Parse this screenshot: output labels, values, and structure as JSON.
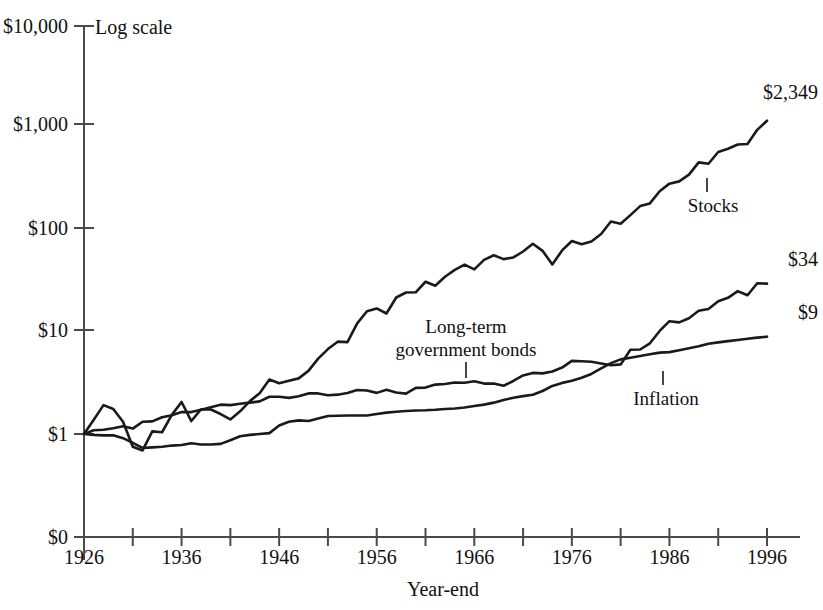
{
  "chart_data": {
    "type": "line",
    "title": "",
    "subtitle": "",
    "scale_note": "Log scale",
    "xlabel": "Year-end",
    "ylabel": "",
    "yscale": "log",
    "xlim": [
      1926,
      1996
    ],
    "ylim": [
      1,
      10000
    ],
    "grid": false,
    "legend_position": "inline-annotations",
    "ytick_labels": [
      "$10,000",
      "$1,000",
      "$100",
      "$10",
      "$1",
      "$0"
    ],
    "ytick_values": [
      10000,
      1000,
      100,
      10,
      1,
      0
    ],
    "xtick_labels": [
      "1926",
      "1936",
      "1946",
      "1956",
      "1966",
      "1976",
      "1986",
      "1996"
    ],
    "xtick_values": [
      1926,
      1936,
      1946,
      1956,
      1966,
      1976,
      1986,
      1996
    ],
    "xtick_minor_values": [
      1931,
      1941,
      1951,
      1961,
      1971,
      1981,
      1991
    ],
    "x": [
      1926,
      1927,
      1928,
      1929,
      1930,
      1931,
      1932,
      1933,
      1934,
      1935,
      1936,
      1937,
      1938,
      1939,
      1940,
      1941,
      1942,
      1943,
      1944,
      1945,
      1946,
      1947,
      1948,
      1949,
      1950,
      1951,
      1952,
      1953,
      1954,
      1955,
      1956,
      1957,
      1958,
      1959,
      1960,
      1961,
      1962,
      1963,
      1964,
      1965,
      1966,
      1967,
      1968,
      1969,
      1970,
      1971,
      1972,
      1973,
      1974,
      1975,
      1976,
      1977,
      1978,
      1979,
      1980,
      1981,
      1982,
      1983,
      1984,
      1985,
      1986,
      1987,
      1988,
      1989,
      1990,
      1991,
      1992,
      1993,
      1994,
      1995,
      1996
    ],
    "series": [
      {
        "name": "Stocks",
        "end_label": "$2,349",
        "annotation": "Stocks",
        "annotation_year": 1988,
        "values": [
          1.0,
          1.38,
          1.92,
          1.76,
          1.32,
          0.75,
          0.69,
          1.06,
          1.04,
          1.54,
          2.06,
          1.34,
          1.75,
          1.74,
          1.57,
          1.39,
          1.67,
          2.1,
          2.51,
          3.42,
          3.15,
          3.33,
          3.51,
          4.16,
          5.48,
          6.8,
          8.04,
          7.96,
          12.15,
          15.97,
          17.02,
          15.19,
          21.78,
          24.39,
          24.52,
          31.09,
          28.38,
          34.84,
          40.62,
          45.71,
          41.1,
          50.95,
          56.6,
          51.79,
          53.84,
          61.53,
          73.22,
          62.47,
          45.94,
          63.06,
          78.06,
          72.5,
          77.23,
          91.46,
          121.12,
          115.13,
          139.89,
          171.45,
          182.21,
          240.09,
          284.73,
          299.79,
          349.43,
          460.18,
          445.85,
          581.65,
          625.88,
          688.6,
          697.6,
          959.25,
          1179.1
        ],
        "final_value": 2349
      },
      {
        "name": "Long-term government bonds",
        "end_label": "$34",
        "annotation": "Long-term\ngovernment bonds",
        "annotation_year": 1965,
        "values": [
          1.0,
          1.09,
          1.1,
          1.14,
          1.19,
          1.13,
          1.32,
          1.33,
          1.46,
          1.53,
          1.64,
          1.64,
          1.73,
          1.83,
          1.94,
          1.92,
          1.98,
          2.03,
          2.09,
          2.32,
          2.32,
          2.26,
          2.34,
          2.5,
          2.5,
          2.4,
          2.43,
          2.52,
          2.7,
          2.67,
          2.53,
          2.71,
          2.55,
          2.49,
          2.83,
          2.85,
          3.05,
          3.09,
          3.2,
          3.18,
          3.29,
          3.12,
          3.13,
          2.97,
          3.31,
          3.75,
          3.97,
          3.93,
          4.1,
          4.48,
          5.21,
          5.17,
          5.11,
          4.91,
          4.72,
          4.81,
          6.7,
          6.74,
          7.75,
          10.24,
          12.76,
          12.43,
          13.63,
          16.13,
          16.83,
          19.98,
          21.63,
          25.16,
          22.92,
          30.06,
          29.78
        ],
        "final_value": 34
      },
      {
        "name": "Inflation",
        "end_label": "$9",
        "annotation": "Inflation",
        "annotation_year": 1982,
        "values": [
          1.0,
          0.98,
          0.97,
          0.97,
          0.91,
          0.82,
          0.73,
          0.74,
          0.75,
          0.77,
          0.78,
          0.81,
          0.79,
          0.79,
          0.8,
          0.87,
          0.95,
          0.98,
          1.0,
          1.02,
          1.21,
          1.32,
          1.36,
          1.34,
          1.42,
          1.5,
          1.51,
          1.52,
          1.52,
          1.52,
          1.57,
          1.62,
          1.65,
          1.68,
          1.7,
          1.71,
          1.73,
          1.76,
          1.78,
          1.82,
          1.88,
          1.94,
          2.03,
          2.15,
          2.27,
          2.35,
          2.43,
          2.64,
          2.96,
          3.17,
          3.33,
          3.56,
          3.88,
          4.4,
          4.95,
          5.39,
          5.6,
          5.82,
          6.05,
          6.28,
          6.35,
          6.63,
          6.92,
          7.24,
          7.68,
          7.91,
          8.14,
          8.36,
          8.58,
          8.8,
          9.0
        ],
        "final_value": 9
      }
    ]
  },
  "annotations": {
    "stocks": "Stocks",
    "bonds_line1": "Long-term",
    "bonds_line2": "government bonds",
    "inflation": "Inflation"
  },
  "end_labels": {
    "stocks": "$2,349",
    "bonds": "$34",
    "inflation": "$9"
  },
  "axis": {
    "scale_note": "Log scale",
    "xlabel": "Year-end",
    "y0": "$10,000",
    "y1": "$1,000",
    "y2": "$100",
    "y3": "$10",
    "y4": "$1",
    "y5": "$0",
    "x0": "1926",
    "x1": "1936",
    "x2": "1946",
    "x3": "1956",
    "x4": "1966",
    "x5": "1976",
    "x6": "1986",
    "x7": "1996"
  }
}
